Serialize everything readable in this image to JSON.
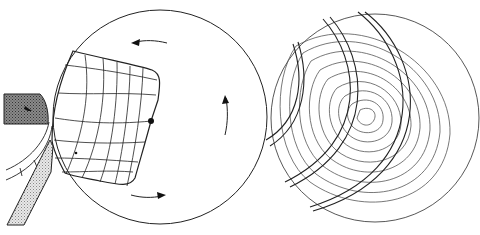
{
  "figure": {
    "panels": [
      {
        "id": "left",
        "description": "Rotating disc with deformed grid, tool and blade",
        "disc": {
          "cx": 160,
          "cy": 117,
          "r": 107
        },
        "rotation_arrows": 3,
        "marker_dot": {
          "cx": 151,
          "cy": 121
        }
      },
      {
        "id": "right",
        "description": "Disc with concentric wavy rings and arc bands",
        "disc": {
          "cx": 368,
          "cy": 118,
          "r": 106
        },
        "ring_count": 10,
        "arc_bands": 3
      }
    ],
    "colors": {
      "stroke": "#222222",
      "ring_stroke": "#555555",
      "hatch_dark": "#777777",
      "hatch_light": "#cccccc",
      "background": "#ffffff"
    }
  }
}
